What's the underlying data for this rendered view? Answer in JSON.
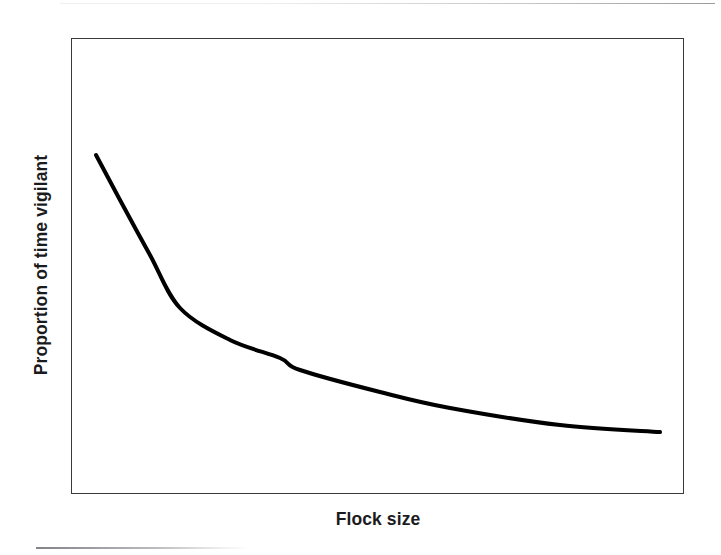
{
  "figure": {
    "background_color": "#ffffff",
    "frame_color": "#3a3a3c",
    "curve_color": "#000000"
  },
  "axes": {
    "x_label": "Flock size",
    "y_label": "Proportion of time vigilant"
  },
  "chart_data": {
    "type": "line",
    "title": "",
    "subtitle": "",
    "xlabel": "Flock size",
    "ylabel": "Proportion of time vigilant",
    "xlim": [
      0,
      100
    ],
    "ylim": [
      0,
      100
    ],
    "grid": false,
    "legend": null,
    "tick_labels": {
      "x": [],
      "y": []
    },
    "annotations": [],
    "series": [
      {
        "name": "Vigilance vs flock size",
        "stroke_width": 4,
        "color": "#000000",
        "x": [
          4,
          8,
          13,
          18,
          26,
          34,
          37,
          50,
          62,
          80,
          96
        ],
        "y": [
          74,
          64,
          52,
          41,
          34,
          30,
          27,
          22,
          19,
          15,
          14
        ],
        "pixel_points": [
          [
            96,
            155
          ],
          [
            120,
            200
          ],
          [
            150,
            255
          ],
          [
            180,
            308
          ],
          [
            230,
            340
          ],
          [
            280,
            358
          ],
          [
            300,
            370
          ],
          [
            380,
            392
          ],
          [
            450,
            408
          ],
          [
            560,
            425
          ],
          [
            660,
            432
          ]
        ]
      }
    ]
  }
}
